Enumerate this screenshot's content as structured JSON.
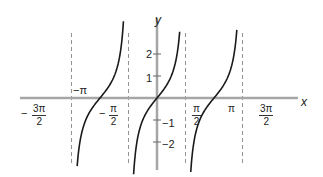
{
  "chart_data": {
    "type": "line",
    "title": "",
    "function": "y = tan(x)",
    "xlabel": "x",
    "ylabel": "y",
    "x_ticks": [
      {
        "value": -4.712,
        "label": "-3π/2"
      },
      {
        "value": -3.1416,
        "label": "-π"
      },
      {
        "value": -1.5708,
        "label": "-π/2"
      },
      {
        "value": 1.5708,
        "label": "π/2"
      },
      {
        "value": 3.1416,
        "label": "π"
      },
      {
        "value": 4.712,
        "label": "3π/2"
      }
    ],
    "y_ticks": [
      {
        "value": 2,
        "label": "2"
      },
      {
        "value": 1,
        "label": "1"
      },
      {
        "value": -1,
        "label": "-1"
      },
      {
        "value": -2,
        "label": "-2"
      }
    ],
    "asymptotes": [
      -4.712,
      -1.5708,
      1.5708,
      4.712
    ],
    "asymptote_style": "dashed",
    "series": [
      {
        "name": "branch around -π",
        "x_range": [
          -4.4,
          -1.85
        ]
      },
      {
        "name": "branch around 0",
        "x_range": [
          -1.29,
          1.25
        ]
      },
      {
        "name": "branch around π",
        "x_range": [
          1.86,
          4.4
        ]
      }
    ],
    "xlim": [
      -5.3,
      5.0
    ],
    "ylim": [
      -3.2,
      3.2
    ],
    "grid": false,
    "legend": "none",
    "colors": {
      "axis": "#a6a6a6",
      "curve": "#1a1a1a",
      "asymptote": "#777777"
    }
  },
  "labels": {
    "x_axis": "x",
    "y_axis": "y",
    "neg_sign": "−",
    "pi": "π",
    "three_pi": "3π",
    "two": "2",
    "neg_pi": "−π",
    "y2": "2",
    "y1": "1",
    "ym1": "−1",
    "ym2": "−2"
  }
}
